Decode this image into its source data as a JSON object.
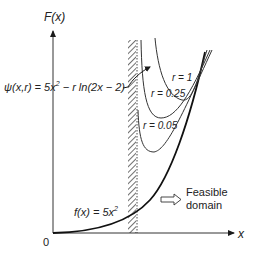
{
  "diagram": {
    "y_axis_label": "F(x)",
    "x_axis_label": "x",
    "origin_label": "0",
    "psi_label": {
      "prefix": "ψ(x,r) = 5x",
      "sup": "2",
      "suffix": " − r ln(2x − 2)"
    },
    "f_label": {
      "prefix": "f(x) = 5x",
      "sup": "2"
    },
    "curves": [
      {
        "label": "r = 1",
        "param": 1
      },
      {
        "label": "r = 0.25",
        "param": 0.25
      },
      {
        "label": "r = 0.05",
        "param": 0.05
      }
    ],
    "feasible_label_line1": "Feasible",
    "feasible_label_line2": "domain",
    "colors": {
      "ink": "#1a1a1a",
      "barrier_curve": "#333333",
      "background": "#ffffff"
    }
  }
}
